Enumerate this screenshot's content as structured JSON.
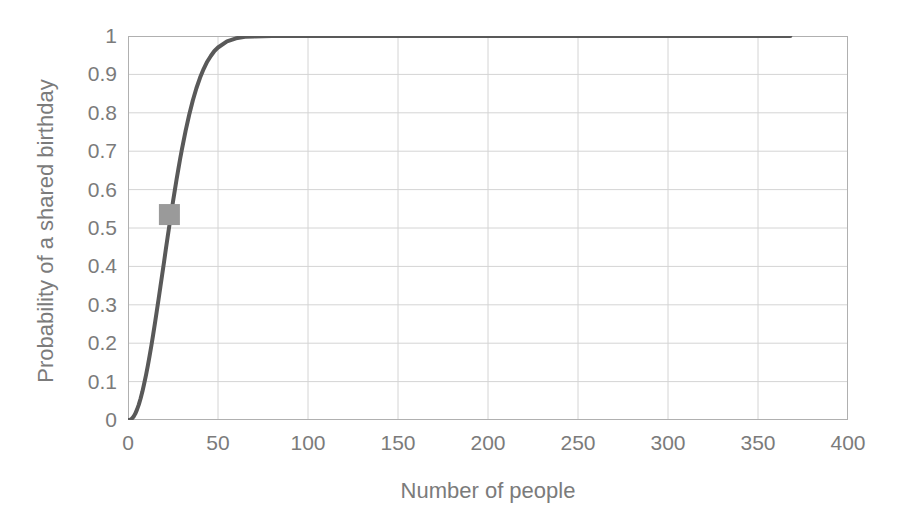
{
  "chart_data": {
    "type": "line",
    "title": "",
    "xlabel": "Number of people",
    "ylabel": "Probability of a shared birthday",
    "xlim": [
      0,
      400
    ],
    "ylim": [
      0,
      1
    ],
    "grid": true,
    "legend": false,
    "x_ticks": [
      "0",
      "50",
      "100",
      "150",
      "200",
      "250",
      "300",
      "350",
      "400"
    ],
    "x_tick_values": [
      0,
      50,
      100,
      150,
      200,
      250,
      300,
      350,
      400
    ],
    "y_ticks": [
      "0",
      "0.1",
      "0.2",
      "0.3",
      "0.4",
      "0.5",
      "0.6",
      "0.7",
      "0.8",
      "0.9",
      "1"
    ],
    "y_tick_values": [
      0,
      0.1,
      0.2,
      0.3,
      0.4,
      0.5,
      0.6,
      0.7,
      0.8,
      0.9,
      1
    ],
    "series": [
      {
        "name": "Probability of a shared birthday",
        "color": "#595959",
        "line_width": 4,
        "x": [
          0,
          1,
          2,
          3,
          4,
          5,
          6,
          7,
          8,
          9,
          10,
          11,
          12,
          13,
          14,
          15,
          16,
          17,
          18,
          19,
          20,
          21,
          22,
          23,
          24,
          25,
          26,
          27,
          28,
          29,
          30,
          32,
          34,
          36,
          38,
          40,
          42,
          44,
          46,
          48,
          50,
          55,
          60,
          65,
          70,
          80,
          90,
          100,
          120,
          140,
          160,
          180,
          200,
          240,
          280,
          320,
          368
        ],
        "y": [
          0,
          0,
          0.003,
          0.008,
          0.016,
          0.027,
          0.04,
          0.056,
          0.074,
          0.095,
          0.117,
          0.141,
          0.167,
          0.194,
          0.223,
          0.253,
          0.284,
          0.315,
          0.347,
          0.379,
          0.411,
          0.444,
          0.476,
          0.507,
          0.538,
          0.569,
          0.598,
          0.627,
          0.654,
          0.681,
          0.706,
          0.753,
          0.795,
          0.832,
          0.864,
          0.891,
          0.914,
          0.933,
          0.948,
          0.961,
          0.97,
          0.986,
          0.994,
          0.998,
          0.999,
          1,
          1,
          1,
          1,
          1,
          1,
          1,
          1,
          1,
          1,
          1,
          1
        ]
      }
    ],
    "markers": [
      {
        "name": "highlight-marker",
        "shape": "square",
        "x": 23,
        "y": 0.535,
        "color": "#9a9a9a",
        "size": 21
      }
    ],
    "axis_color": "#b0b0b0",
    "grid_color": "#d4d4d4",
    "tick_label_color": "#7b7b7b"
  }
}
